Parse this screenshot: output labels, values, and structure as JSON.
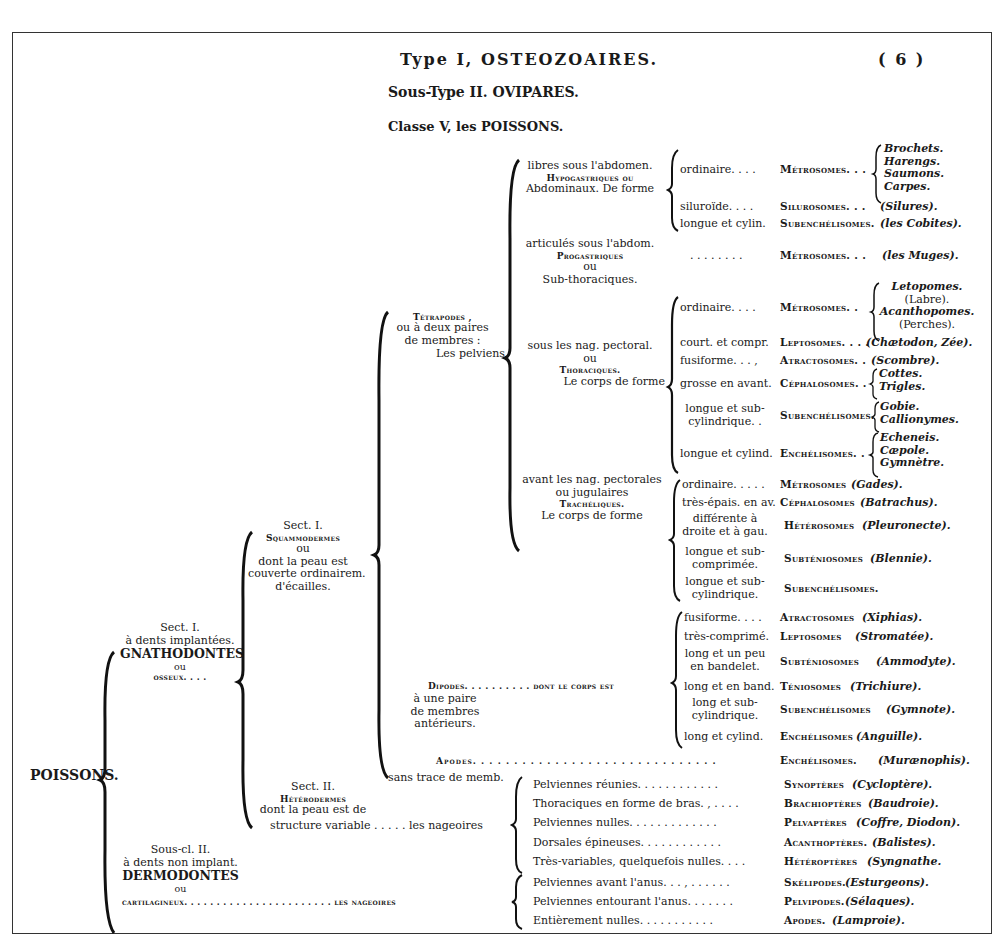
{
  "header": {
    "type": "Type I, OSTEOZOAIRES.",
    "page_number": "( 6 )",
    "subtype": "Sous-Type II.  OVIPARES.",
    "classe": "Classe V, les POISSONS."
  },
  "root": "POISSONS.",
  "subclass1": {
    "lines": [
      "Sect. I.",
      "à dents implantées.",
      "GNATHODONTES",
      "ou",
      "osseux. . . ."
    ]
  },
  "subclass2": {
    "lines": [
      "Sous-cl. II.",
      "à dents non implant.",
      "DERMODONTES",
      "ou",
      "cartilagineux. . . . . . . . . . . . . . . . . . . . . . . les nageoires"
    ]
  },
  "sect1": {
    "lines": [
      "Sect. I.",
      "Squammodermes",
      "ou",
      "dont la peau est",
      "couverte ordinairem.",
      "d'écailles."
    ]
  },
  "sect2": {
    "lines": [
      "Sect. II.",
      "Hétérodermes",
      "dont la peau est de",
      "structure variable . . . . . les nageoires"
    ]
  },
  "tetrapodes": {
    "lines": [
      "Tétrapodes ,",
      "ou à deux paires",
      "de membres :",
      "Les pelviens"
    ]
  },
  "dipodes": {
    "lines": [
      "Dipodes. . . . . . . . . . dont le corps est",
      "à une paire",
      "de membres",
      "antérieurs."
    ]
  },
  "apodes": {
    "line1": "Apodes. . . . . . . . . . . . . . . . . . . . . . . . . . . . Enchélisomes. (Muraenophis).",
    "label": "Apodes. . . . . . . . . . . . . . . . . . . . . . . . . . . . . .",
    "family": "Enchélisomes.",
    "example": "(Murænophis).",
    "line2": "sans trace de memb."
  },
  "abdominaux": {
    "lines": [
      "libres sous l'abdomen.",
      "Hypogastriques ou",
      "Abdominaux.  De forme"
    ],
    "rows": [
      {
        "form": "ordinaire.  . . .",
        "family": "Métrosomes. . .",
        "examples": [
          "Brochets.",
          "Harengs.",
          "Saumons.",
          "Carpes."
        ]
      },
      {
        "form": "siluroïde.  . . .",
        "family": "Silurosomes.  . .",
        "examples": [
          "(Silures)."
        ]
      },
      {
        "form": "longue et cylin.",
        "family": "Subenchélisomes.",
        "examples": [
          "(les Cobites)."
        ]
      }
    ]
  },
  "subthoraciques": {
    "lines": [
      "articulés sous l'abdom.",
      "Progastriques",
      "ou",
      "Sub-thoraciques."
    ],
    "form": ". . . . . . . .",
    "family": "Métrosomes. . .",
    "example": "(les Muges)."
  },
  "thoraciques": {
    "lines": [
      "sous les nag. pectoral.",
      "ou",
      "Thoraciques.",
      "Le corps de forme"
    ],
    "rows": [
      {
        "form": "ordinaire.  . . .",
        "family": "Métrosomes.  .",
        "examples": [
          "Letopomes.",
          "(Labre).",
          "Acanthopomes.",
          "(Perches)."
        ]
      },
      {
        "form": "court. et compr.",
        "family": "Leptosomes. . . .",
        "examples": [
          "(Chætodon, Zée)."
        ]
      },
      {
        "form": "fusiforme. . . ,",
        "family": "Atractosomes.  .",
        "examples": [
          "(Scombre)."
        ]
      },
      {
        "form": "grosse en avant.",
        "family": "Céphalosomes.  .",
        "examples": [
          "Cottes.",
          "Trigles."
        ]
      },
      {
        "form": [
          "longue et sub-",
          "cylindrique.  ."
        ],
        "family": "Subenchélisomes.",
        "examples": [
          "Gobie.",
          "Callionymes."
        ]
      },
      {
        "form": "longue et cylind.",
        "family": "Enchélisomes.  .",
        "examples": [
          "Echeneis.",
          "Cæpole.",
          "Gymnètre."
        ]
      }
    ]
  },
  "jugulaires": {
    "lines": [
      "avant les nag. pectorales",
      "ou jugulaires",
      "Trachéliques.",
      "Le corps de forme"
    ],
    "rows": [
      {
        "form": "ordinaire. . . . .",
        "family": "Métrosomes",
        "example": "(Gades)."
      },
      {
        "form": "très-épais. en av.",
        "family": "Céphalosomes",
        "example": "(Batrachus)."
      },
      {
        "form": [
          "différente à",
          "droite et à gau."
        ],
        "family": "Hétérosomes",
        "example": "(Pleuronecte)."
      },
      {
        "form": [
          "longue et sub-",
          "comprimée."
        ],
        "family": "Subténiosomes",
        "example": "(Blennie)."
      },
      {
        "form": [
          "longue et sub-",
          "cylindrique."
        ],
        "family": "Subenchélisomes.",
        "example": ""
      }
    ]
  },
  "dipodes_rows": [
    {
      "form": "fusiforme.  . . .",
      "family": "Atractosomes",
      "example": "(Xiphias)."
    },
    {
      "form": "très-comprimé.",
      "family": "Leptosomes",
      "example": "(Stromatée)."
    },
    {
      "form": [
        "long et un peu",
        "en bandelet."
      ],
      "family": "Subténiosomes",
      "example": "(Ammodyte)."
    },
    {
      "form": "long et en band.",
      "family": "Téniosomes",
      "example": "(Trichiure)."
    },
    {
      "form": [
        "long et sub-",
        "cylindrique."
      ],
      "family": "Subenchélisomes",
      "example": "(Gymnote)."
    },
    {
      "form": "long et cylind.",
      "family": "Enchélisomes",
      "example": "(Anguille)."
    }
  ],
  "heterodermes_rows": [
    {
      "label": "Pelviennes réunies. . . . . . . . . . . .",
      "family": "Synoptères",
      "example": "(Cycloptère)."
    },
    {
      "label": "Thoraciques en forme de bras. , . . . .",
      "family": "Brachioptères",
      "example": "(Baudroie)."
    },
    {
      "label": "Pelviennes nulles. . . . . . . . . . . . .",
      "family": "Pelvaptères",
      "example": "(Coffre, Diodon)."
    },
    {
      "label": "Dorsales épineuses. . . . . . . . . . . .",
      "family": "Acanthoptères.",
      "example": "(Balistes)."
    },
    {
      "label": "Très-variables,  quelquefois nulles. . . .",
      "family": "Hétéroptères",
      "example": "(Syngnathe."
    }
  ],
  "dermodontes_rows": [
    {
      "label": "Pelviennes avant l'anus. . . , . . . . . .",
      "family": "Skélipodes.",
      "example": "(Esturgeons)."
    },
    {
      "label": "Pelviennes entourant l'anus. . . . . . .",
      "family": "Pelvipodes.",
      "example": "(Sélaques)."
    },
    {
      "label": "Entièrement nulles. . . . . . . . . . .",
      "family": "Apodes.",
      "example": "(Lamproie)."
    }
  ]
}
